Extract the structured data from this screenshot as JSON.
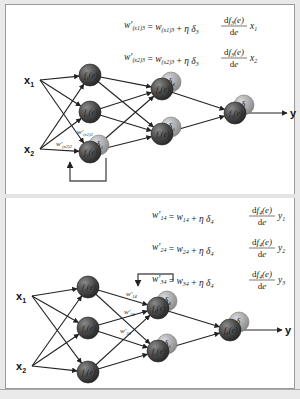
{
  "panels": [
    {
      "id": "top",
      "inputs": [
        "x1",
        "x2"
      ],
      "input_labels": [
        {
          "base": "x",
          "sub": "1"
        },
        {
          "base": "x",
          "sub": "2"
        }
      ],
      "output_label": "y",
      "layer1": [
        {
          "fn": "f1(e)"
        },
        {
          "fn": "f2(e)"
        },
        {
          "fn": "f3(e)",
          "delta": "δ3"
        }
      ],
      "layer2": [
        {
          "fn": "f4(e)",
          "delta": "δ4"
        },
        {
          "fn": "f5(e)",
          "delta": "δ5"
        }
      ],
      "output": {
        "fn": "f6(e)",
        "delta": "δ"
      },
      "weight_labels": [
        "w'(x1)3",
        "w'(x2)3"
      ],
      "equations": [
        "w'(x1)3 = w(x1)3 + η δ3 · df3(e)/de · x1",
        "w'(x2)3 = w(x2)3 + η δ3 · df3(e)/de · x2"
      ]
    },
    {
      "id": "bottom",
      "inputs": [
        "x1",
        "x2"
      ],
      "input_labels": [
        {
          "base": "x",
          "sub": "1"
        },
        {
          "base": "x",
          "sub": "2"
        }
      ],
      "output_label": "y",
      "layer1": [
        {
          "fn": "f1(e)"
        },
        {
          "fn": "f2(e)"
        },
        {
          "fn": "f3(e)"
        }
      ],
      "layer2": [
        {
          "fn": "f4(e)",
          "delta": "δ4"
        },
        {
          "fn": "f5(e)",
          "delta": "δ5"
        }
      ],
      "output": {
        "fn": "f6(e)",
        "delta": "δ"
      },
      "weight_labels": [
        "w'14",
        "w'24",
        "w'34"
      ],
      "equations": [
        "w'14 = w14 + η δ4 · df4(e)/de · y1",
        "w'24 = w24 + η δ4 · df4(e)/de · y2",
        "w'34 = w34 + η δ4 · df4(e)/de · y3"
      ]
    }
  ],
  "colors": {
    "node_dark": "#4a4a4a",
    "node_delta": "#a8a8a8",
    "arrow": "#222222",
    "feedback": "#555555"
  }
}
